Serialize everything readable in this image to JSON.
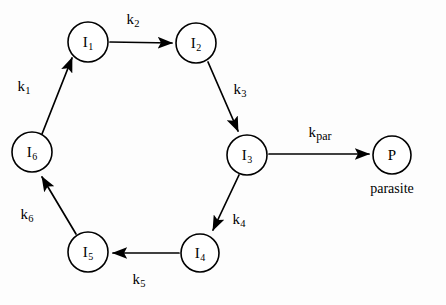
{
  "diagram": {
    "background_color": "#fdfdfd",
    "stroke_color": "#000000",
    "nodes": [
      {
        "id": "I1",
        "label": "I",
        "sub": "1",
        "cx": 88,
        "cy": 42,
        "r": 20
      },
      {
        "id": "I2",
        "label": "I",
        "sub": "2",
        "cx": 196,
        "cy": 43,
        "r": 20
      },
      {
        "id": "I3",
        "label": "I",
        "sub": "3",
        "cx": 247,
        "cy": 155,
        "r": 20
      },
      {
        "id": "I4",
        "label": "I",
        "sub": "4",
        "cx": 200,
        "cy": 253,
        "r": 19
      },
      {
        "id": "I5",
        "label": "I",
        "sub": "5",
        "cx": 88,
        "cy": 252,
        "r": 20
      },
      {
        "id": "I6",
        "label": "I",
        "sub": "6",
        "cx": 32,
        "cy": 152,
        "r": 20
      },
      {
        "id": "P",
        "label": "P",
        "sub": "",
        "cx": 392,
        "cy": 155,
        "r": 19
      }
    ],
    "edges": [
      {
        "id": "e-k1",
        "from": "I6",
        "to": "I1",
        "rate": "k",
        "rate_sub": "1",
        "label_x": 24,
        "label_y": 88
      },
      {
        "id": "e-k2",
        "from": "I1",
        "to": "I2",
        "rate": "k",
        "rate_sub": "2",
        "label_x": 133,
        "label_y": 21
      },
      {
        "id": "e-k3",
        "from": "I2",
        "to": "I3",
        "rate": "k",
        "rate_sub": "3",
        "label_x": 240,
        "label_y": 91
      },
      {
        "id": "e-k4",
        "from": "I3",
        "to": "I4",
        "rate": "k",
        "rate_sub": "4",
        "label_x": 239,
        "label_y": 221
      },
      {
        "id": "e-k5",
        "from": "I4",
        "to": "I5",
        "rate": "k",
        "rate_sub": "5",
        "label_x": 139,
        "label_y": 281
      },
      {
        "id": "e-k6",
        "from": "I5",
        "to": "I6",
        "rate": "k",
        "rate_sub": "6",
        "label_x": 27,
        "label_y": 216
      },
      {
        "id": "e-kpar",
        "from": "I3",
        "to": "P",
        "rate": "k",
        "rate_sub": "par",
        "label_x": 320,
        "label_y": 134
      }
    ],
    "captions": [
      {
        "id": "parasite-caption",
        "text": "parasite",
        "x": 392,
        "y": 189
      }
    ]
  }
}
